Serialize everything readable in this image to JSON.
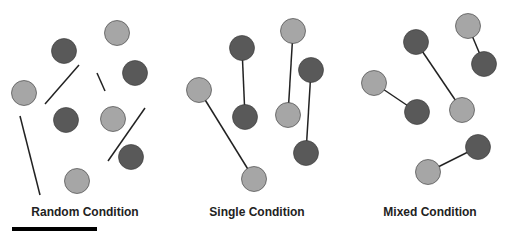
{
  "colors": {
    "light": "#a6a6a6",
    "dark": "#595959",
    "stroke": "#333333"
  },
  "panels": [
    {
      "label": "Random Condition",
      "circles": [
        {
          "x": 117,
          "y": 33,
          "tone": "light"
        },
        {
          "x": 64,
          "y": 51,
          "tone": "dark"
        },
        {
          "x": 135,
          "y": 73,
          "tone": "dark"
        },
        {
          "x": 24,
          "y": 93,
          "tone": "light"
        },
        {
          "x": 66,
          "y": 120,
          "tone": "dark"
        },
        {
          "x": 113,
          "y": 119,
          "tone": "light"
        },
        {
          "x": 131,
          "y": 157,
          "tone": "dark"
        },
        {
          "x": 77,
          "y": 181,
          "tone": "light"
        }
      ],
      "lines": [
        {
          "x1": 79,
          "y1": 65,
          "x2": 45,
          "y2": 104
        },
        {
          "x1": 97,
          "y1": 73,
          "x2": 105,
          "y2": 91
        },
        {
          "x1": 145,
          "y1": 108,
          "x2": 108,
          "y2": 161
        },
        {
          "x1": 20,
          "y1": 116,
          "x2": 40,
          "y2": 195
        }
      ]
    },
    {
      "label": "Single Condition",
      "circles": [
        {
          "x": 293,
          "y": 31,
          "tone": "light"
        },
        {
          "x": 242,
          "y": 48,
          "tone": "dark"
        },
        {
          "x": 311,
          "y": 70,
          "tone": "dark"
        },
        {
          "x": 199,
          "y": 90,
          "tone": "light"
        },
        {
          "x": 245,
          "y": 117,
          "tone": "dark"
        },
        {
          "x": 288,
          "y": 115,
          "tone": "light"
        },
        {
          "x": 306,
          "y": 153,
          "tone": "dark"
        },
        {
          "x": 254,
          "y": 179,
          "tone": "light"
        }
      ],
      "lines": [
        {
          "x1": 242,
          "y1": 48,
          "x2": 245,
          "y2": 117
        },
        {
          "x1": 293,
          "y1": 31,
          "x2": 288,
          "y2": 115
        },
        {
          "x1": 311,
          "y1": 70,
          "x2": 306,
          "y2": 153
        },
        {
          "x1": 199,
          "y1": 90,
          "x2": 254,
          "y2": 179
        }
      ]
    },
    {
      "label": "Mixed Condition",
      "circles": [
        {
          "x": 468,
          "y": 26,
          "tone": "light"
        },
        {
          "x": 416,
          "y": 42,
          "tone": "dark"
        },
        {
          "x": 484,
          "y": 64,
          "tone": "dark"
        },
        {
          "x": 374,
          "y": 83,
          "tone": "light"
        },
        {
          "x": 417,
          "y": 112,
          "tone": "dark"
        },
        {
          "x": 462,
          "y": 110,
          "tone": "light"
        },
        {
          "x": 478,
          "y": 147,
          "tone": "dark"
        },
        {
          "x": 428,
          "y": 172,
          "tone": "light"
        }
      ],
      "lines": [
        {
          "x1": 468,
          "y1": 26,
          "x2": 484,
          "y2": 64
        },
        {
          "x1": 416,
          "y1": 42,
          "x2": 462,
          "y2": 110
        },
        {
          "x1": 374,
          "y1": 83,
          "x2": 417,
          "y2": 112
        },
        {
          "x1": 478,
          "y1": 147,
          "x2": 428,
          "y2": 172
        }
      ]
    }
  ]
}
